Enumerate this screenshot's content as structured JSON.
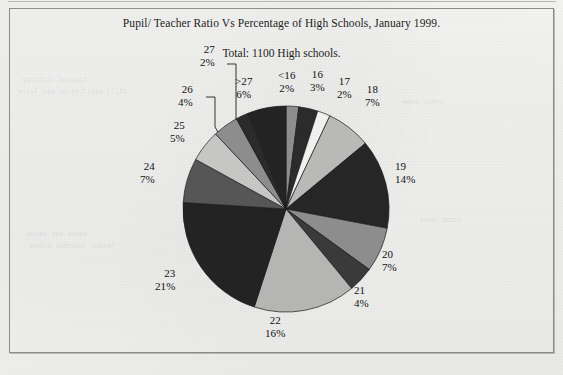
{
  "document": {
    "frame_label": "chart-frame"
  },
  "chart_data": {
    "type": "pie",
    "title": "Pupil/ Teacher Ratio Vs Percentage of High Schools, January 1999.",
    "subtitle": "Total: 1100 High schools.",
    "xlabel": "",
    "ylabel": "",
    "legend": "none",
    "grid": false,
    "total_label": "Total: 1100 High schools.",
    "total_value": 1100,
    "units": "percent",
    "categories": [
      "<16",
      "16",
      "17",
      "18",
      "19",
      "20",
      "21",
      "22",
      "23",
      "24",
      "25",
      "26",
      "27",
      ">27"
    ],
    "values": [
      2,
      3,
      2,
      7,
      14,
      7,
      4,
      16,
      21,
      7,
      5,
      4,
      2,
      6
    ],
    "slices": [
      {
        "name": "<16",
        "pct": "2%",
        "value": 2,
        "color": "#8d8d8d"
      },
      {
        "name": "16",
        "pct": "3%",
        "value": 3,
        "color": "#2b2b2b"
      },
      {
        "name": "17",
        "pct": "2%",
        "value": 2,
        "color": "#f0f0ee"
      },
      {
        "name": "18",
        "pct": "7%",
        "value": 7,
        "color": "#b9b9b7"
      },
      {
        "name": "19",
        "pct": "14%",
        "value": 14,
        "color": "#262626"
      },
      {
        "name": "20",
        "pct": "7%",
        "value": 7,
        "color": "#8d8d8d"
      },
      {
        "name": "21",
        "pct": "4%",
        "value": 4,
        "color": "#3a3a3a"
      },
      {
        "name": "22",
        "pct": "16%",
        "value": 16,
        "color": "#b5b5b3"
      },
      {
        "name": "23",
        "pct": "21%",
        "value": 21,
        "color": "#232323"
      },
      {
        "name": "24",
        "pct": "7%",
        "value": 7,
        "color": "#565656"
      },
      {
        "name": "25",
        "pct": "5%",
        "value": 5,
        "color": "#c6c6c4"
      },
      {
        "name": "26",
        "pct": "4%",
        "value": 4,
        "color": "#8d8d8d"
      },
      {
        "name": "27",
        "pct": "2%",
        "value": 2,
        "color": "#2b2b2b"
      },
      {
        ">27_note": "",
        "name": ">27",
        "pct": "6%",
        "value": 6,
        "color": "#242424"
      }
    ]
  },
  "labels": {
    "l_lt16": {
      "name": "<16",
      "pct": "2%"
    },
    "l_16": {
      "name": "16",
      "pct": "3%"
    },
    "l_17": {
      "name": "17",
      "pct": "2%"
    },
    "l_18": {
      "name": "18",
      "pct": "7%"
    },
    "l_19": {
      "name": "19",
      "pct": "14%"
    },
    "l_20": {
      "name": "20",
      "pct": "7%"
    },
    "l_21": {
      "name": "21",
      "pct": "4%"
    },
    "l_22": {
      "name": "22",
      "pct": "16%"
    },
    "l_23": {
      "name": "23",
      "pct": "21%"
    },
    "l_24": {
      "name": "24",
      "pct": "7%"
    },
    "l_25": {
      "name": "25",
      "pct": "5%"
    },
    "l_26": {
      "name": "26",
      "pct": "4%"
    },
    "l_27": {
      "name": "27",
      "pct": "2%"
    },
    "l_gt27": {
      "name": ">27",
      "pct": "6%"
    }
  },
  "colors": {
    "paper": "#f1f1ef",
    "frame": "#8c8c8a",
    "text": "#111111",
    "slice_dark": "#242424",
    "slice_mid": "#8d8d8d",
    "slice_light": "#b9b9b7"
  }
}
